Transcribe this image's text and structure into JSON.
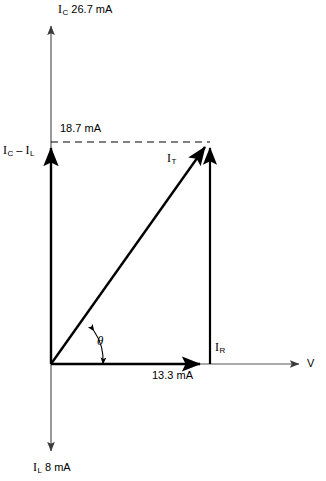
{
  "diagram": {
    "type": "phasor-diagram",
    "axes": {
      "vertical_label_top": "I",
      "vertical_sub_top": "C",
      "vertical_value_top": "26.7 mA",
      "vertical_label_bottom": "I",
      "vertical_sub_bottom": "L",
      "vertical_value_bottom": "8 mA",
      "horizontal_label": "V"
    },
    "labels": {
      "resultant_reactive": "I",
      "resultant_reactive_sub1": "C",
      "resultant_reactive_minus": " – ",
      "resultant_reactive_i2": "I",
      "resultant_reactive_sub2": "L",
      "reactive_value": "18.7 mA",
      "total_current": "I",
      "total_current_sub": "T",
      "resistive_current": "I",
      "resistive_current_sub": "R",
      "resistive_value": "13.3 mA",
      "angle": "θ"
    },
    "colors": {
      "stroke": "#000000",
      "axis": "#555555",
      "background": "#ffffff"
    },
    "values": {
      "ic_ma": 26.7,
      "il_ma": 8,
      "ic_minus_il_ma": 18.7,
      "ir_ma": 13.3
    }
  }
}
